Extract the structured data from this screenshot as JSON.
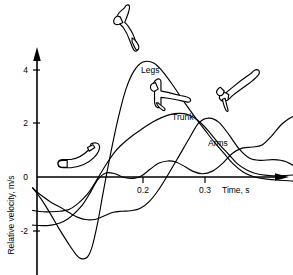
{
  "chart_data": {
    "type": "line",
    "title": "",
    "xlabel": "Time, s",
    "ylabel": "Relative velocity, m/s",
    "xlim": [
      -0.08,
      0.4
    ],
    "ylim": [
      -3.3,
      4.8
    ],
    "xticks": [
      0.2,
      0.3
    ],
    "xticklabels": [
      "0.2",
      "0.3"
    ],
    "yticks": [
      4,
      2,
      0,
      -2
    ],
    "yticklabels": [
      "4",
      "2",
      "0",
      "-2"
    ],
    "grid": false,
    "legend_position": "inline-annotations",
    "annotations": [
      {
        "text": "Legs",
        "x": 0.123,
        "y": 3.95
      },
      {
        "text": "Trunk",
        "x": 0.205,
        "y": 2.25
      },
      {
        "text": "Arms",
        "x": 0.262,
        "y": 1.45
      }
    ],
    "series": [
      {
        "name": "Legs",
        "x": [
          -0.078,
          -0.065,
          -0.05,
          -0.035,
          -0.02,
          -0.008,
          0.0,
          0.01,
          0.018,
          0.027,
          0.036,
          0.048,
          0.06,
          0.072,
          0.085,
          0.1,
          0.118,
          0.135,
          0.152,
          0.168,
          0.185,
          0.2,
          0.215,
          0.23,
          0.245,
          0.262,
          0.28,
          0.3,
          0.32,
          0.34,
          0.36,
          0.382
        ],
        "y": [
          -0.4,
          -0.8,
          -1.35,
          -1.95,
          -2.5,
          -2.9,
          -3.05,
          -3.0,
          -2.6,
          -1.7,
          -0.55,
          0.9,
          2.2,
          3.25,
          3.95,
          4.3,
          4.25,
          3.85,
          3.3,
          2.75,
          2.2,
          1.75,
          1.3,
          0.9,
          0.5,
          0.18,
          0.0,
          -0.08,
          -0.12,
          -0.15,
          -0.18,
          -0.2
        ]
      },
      {
        "name": "Trunk",
        "x": [
          -0.078,
          -0.062,
          -0.048,
          -0.034,
          -0.02,
          -0.008,
          0.004,
          0.015,
          0.027,
          0.04,
          0.055,
          0.07,
          0.085,
          0.1,
          0.115,
          0.13,
          0.145,
          0.158,
          0.17,
          0.182,
          0.195,
          0.208,
          0.222,
          0.238,
          0.252,
          0.266,
          0.28,
          0.3,
          0.32,
          0.345,
          0.368,
          0.382
        ],
        "y": [
          -1.25,
          -1.3,
          -1.3,
          -1.28,
          -1.22,
          -1.05,
          -0.8,
          -0.5,
          -0.05,
          0.45,
          0.95,
          1.3,
          1.58,
          1.82,
          2.05,
          2.22,
          2.34,
          2.38,
          2.35,
          2.22,
          1.98,
          1.65,
          1.25,
          0.85,
          0.5,
          0.28,
          0.14,
          0.06,
          0.04,
          0.08,
          0.15,
          0.18
        ]
      },
      {
        "name": "Arms",
        "x": [
          -0.078,
          -0.062,
          -0.048,
          -0.034,
          -0.022,
          -0.01,
          0.002,
          0.014,
          0.027,
          0.04,
          0.055,
          0.07,
          0.085,
          0.098,
          0.112,
          0.126,
          0.14,
          0.154,
          0.168,
          0.182,
          0.196,
          0.212,
          0.228,
          0.244,
          0.26,
          0.276,
          0.292,
          0.308,
          0.325,
          0.345,
          0.365,
          0.382
        ],
        "y": [
          -1.8,
          -1.82,
          -1.8,
          -1.72,
          -1.58,
          -1.35,
          -1.05,
          -0.62,
          -0.1,
          0.15,
          0.12,
          -0.02,
          -0.05,
          0.05,
          0.3,
          0.52,
          0.6,
          0.55,
          0.38,
          0.2,
          0.12,
          0.22,
          0.5,
          0.88,
          1.08,
          1.12,
          1.2,
          1.55,
          2.0,
          2.28,
          2.2,
          1.92
        ]
      },
      {
        "name": "unlabeled-fourth",
        "x": [
          -0.078,
          -0.062,
          -0.048,
          -0.032,
          -0.018,
          -0.004,
          0.01,
          0.024,
          0.038,
          0.052,
          0.066,
          0.08,
          0.095,
          0.11,
          0.126,
          0.142,
          0.158,
          0.174,
          0.19,
          0.206,
          0.222,
          0.238,
          0.255,
          0.272,
          0.29,
          0.31,
          0.33,
          0.352,
          0.37,
          0.382
        ],
        "y": [
          -0.42,
          -0.72,
          -0.95,
          -1.15,
          -1.35,
          -1.52,
          -1.6,
          -1.58,
          -1.45,
          -1.32,
          -1.28,
          -1.26,
          -1.18,
          -0.92,
          -0.45,
          0.15,
          0.78,
          1.42,
          2.02,
          2.2,
          2.05,
          1.6,
          1.05,
          0.7,
          0.62,
          0.65,
          0.58,
          0.3,
          0.08,
          -0.05
        ]
      }
    ]
  },
  "figurines": [
    {
      "name": "pose-crouched-start",
      "caption": "",
      "phase": "crouch"
    },
    {
      "name": "pose-extending",
      "caption": "",
      "phase": "extension"
    },
    {
      "name": "pose-mid-flight",
      "caption": "",
      "phase": "mid-flight"
    },
    {
      "name": "pose-upright",
      "caption": "",
      "phase": "upright"
    }
  ],
  "colors": {
    "background": "#ffffff",
    "axis": "#000000",
    "curve": "#000000",
    "text": "#000000"
  }
}
